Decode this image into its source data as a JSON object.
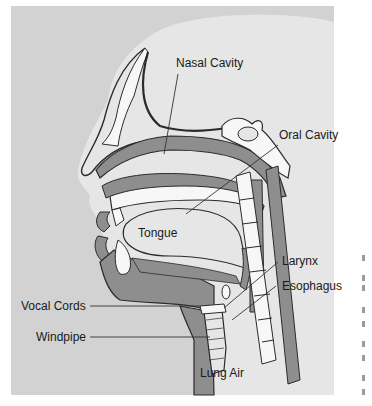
{
  "diagram": {
    "colors": {
      "background": "#d2d2d2",
      "head": "#e6e6e6",
      "tissue": "#8e8e8e",
      "bone": "#f7f7f7",
      "outline": "#2b2b2b",
      "leader": "#333333"
    },
    "labels": [
      {
        "id": "nasal-cavity",
        "text": "Nasal Cavity"
      },
      {
        "id": "oral-cavity",
        "text": "Oral Cavity"
      },
      {
        "id": "tongue",
        "text": "Tongue"
      },
      {
        "id": "larynx",
        "text": "Larynx"
      },
      {
        "id": "esophagus",
        "text": "Esophagus"
      },
      {
        "id": "vocal-cords",
        "text": "Vocal Cords"
      },
      {
        "id": "windpipe",
        "text": "Windpipe"
      },
      {
        "id": "lung-air",
        "text": "Lung Air"
      }
    ]
  }
}
